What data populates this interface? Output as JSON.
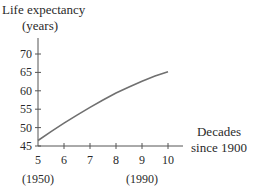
{
  "chart_data": {
    "type": "line",
    "title": "",
    "ylabel": "Life expectancy (years)",
    "ylabel_lines": [
      "Life expectancy",
      "(years)"
    ],
    "xlabel": "Decades since 1900",
    "xlabel_lines": [
      "Decades",
      "since 1900"
    ],
    "xlim": [
      5,
      10
    ],
    "ylim": [
      45,
      72
    ],
    "x_ticks": [
      5,
      6,
      7,
      8,
      9,
      10
    ],
    "x_tick_labels": [
      "5",
      "6",
      "7",
      "8",
      "9",
      "10"
    ],
    "x_annotations": [
      {
        "x": 5,
        "label": "(1950)"
      },
      {
        "x": 9,
        "label": "(1990)"
      }
    ],
    "y_ticks": [
      45,
      50,
      55,
      60,
      65,
      70
    ],
    "y_tick_labels": [
      "45",
      "50",
      "55",
      "60",
      "65",
      "70"
    ],
    "grid": false,
    "legend": null,
    "series": [
      {
        "name": "Life expectancy",
        "x": [
          5,
          5.5,
          6,
          6.5,
          7,
          7.5,
          8,
          8.5,
          9,
          9.5,
          10
        ],
        "values": [
          46.5,
          48.9,
          51.2,
          53.4,
          55.5,
          57.5,
          59.4,
          61.0,
          62.6,
          64.0,
          65.2
        ]
      }
    ],
    "line_color": "#707070"
  }
}
